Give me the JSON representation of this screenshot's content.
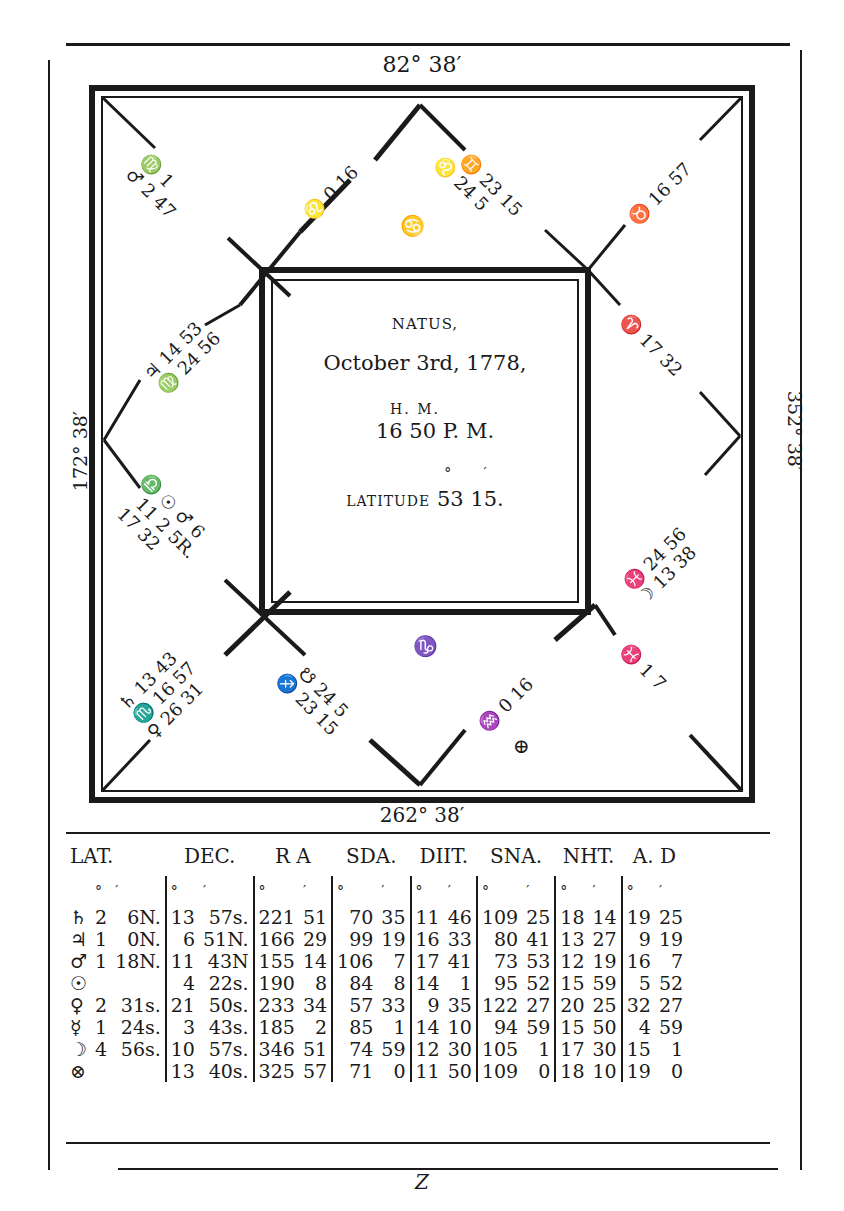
{
  "figure": {
    "type": "horoscope_square_chart",
    "midheaven_label": "82° 38′",
    "imum_coeli_label": "262° 38′",
    "ascendant_side_label": "172° 38′",
    "descendant_side_label": "352° 38′",
    "footer_letter": "Z"
  },
  "center": {
    "title": "NATUS,",
    "date": "October 3rd, 1778,",
    "time_units": "H.  M.",
    "time": "16 50 P. M.",
    "lat_units": "°  ′",
    "latitude_label": "LATITUDE",
    "latitude_value": "53 15."
  },
  "houses": [
    {
      "name": "house-10-cusp",
      "line1": "♌ 0 16"
    },
    {
      "name": "house-11-cusp",
      "line1": "♊ 23 15",
      "line2": "♌ 24 5"
    },
    {
      "name": "house-12-cusp",
      "line1": "♉ 16 57"
    },
    {
      "name": "house-9-cusp",
      "line1": "♍ 1",
      "line2": "♂ 2 47",
      "extra": "♉ 7"
    },
    {
      "name": "house-8-cusp",
      "line1": "♃ 14 53",
      "line2": "♍ 24 56"
    },
    {
      "name": "house-7-cusp",
      "line1": "♎ ☉ ♂ 6",
      "line2": "11 2 5R.",
      "line3": "17 32"
    },
    {
      "name": "house-1-cusp",
      "line1": "♈ 17 32"
    },
    {
      "name": "house-2-cusp",
      "line1": "♓ 24 56",
      "line2": "☽ 13 38"
    },
    {
      "name": "house-6-cusp",
      "line1": "♄ 13 43",
      "line2": "♏ 16 57",
      "line3": "♀ 26 31"
    },
    {
      "name": "house-5-cusp",
      "line1": "☋ 24 5",
      "line2": "♐ 23 15"
    },
    {
      "name": "house-4-cusp",
      "line1": "♒ 0 16"
    },
    {
      "name": "house-3-cusp",
      "line1": "♓ 1 7"
    },
    {
      "name": "sign-cancer",
      "line1": "♋"
    },
    {
      "name": "sign-capricorn",
      "line1": "♑"
    },
    {
      "name": "part-of-fortune",
      "line1": "⊕"
    }
  ],
  "table": {
    "headers": [
      "LAT.",
      "DEC.",
      "R A",
      "SDA.",
      "DIIT.",
      "SNA.",
      "NHT.",
      "A. D"
    ],
    "units": [
      "°",
      "′"
    ],
    "rows": [
      {
        "planet": "♄",
        "lat": [
          "2",
          "6N."
        ],
        "dec": [
          "13",
          "57s."
        ],
        "ra": [
          "221",
          "51"
        ],
        "sda": [
          "70",
          "35"
        ],
        "diit": [
          "11",
          "46"
        ],
        "sna": [
          "109",
          "25"
        ],
        "nht": [
          "18",
          "14"
        ],
        "ad": [
          "19",
          "25"
        ]
      },
      {
        "planet": "♃",
        "lat": [
          "1",
          "0N."
        ],
        "dec": [
          "6",
          "51N."
        ],
        "ra": [
          "166",
          "29"
        ],
        "sda": [
          "99",
          "19"
        ],
        "diit": [
          "16",
          "33"
        ],
        "sna": [
          "80",
          "41"
        ],
        "nht": [
          "13",
          "27"
        ],
        "ad": [
          "9",
          "19"
        ]
      },
      {
        "planet": "♂",
        "lat": [
          "1",
          "18N."
        ],
        "dec": [
          "11",
          "43N"
        ],
        "ra": [
          "155",
          "14"
        ],
        "sda": [
          "106",
          "7"
        ],
        "diit": [
          "17",
          "41"
        ],
        "sna": [
          "73",
          "53"
        ],
        "nht": [
          "12",
          "19"
        ],
        "ad": [
          "16",
          "7"
        ]
      },
      {
        "planet": "☉",
        "lat": [
          "",
          ""
        ],
        "dec": [
          "4",
          "22s."
        ],
        "ra": [
          "190",
          "8"
        ],
        "sda": [
          "84",
          "8"
        ],
        "diit": [
          "14",
          "1"
        ],
        "sna": [
          "95",
          "52"
        ],
        "nht": [
          "15",
          "59"
        ],
        "ad": [
          "5",
          "52"
        ]
      },
      {
        "planet": "♀",
        "lat": [
          "2",
          "31s."
        ],
        "dec": [
          "21",
          "50s."
        ],
        "ra": [
          "233",
          "34"
        ],
        "sda": [
          "57",
          "33"
        ],
        "diit": [
          "9",
          "35"
        ],
        "sna": [
          "122",
          "27"
        ],
        "nht": [
          "20",
          "25"
        ],
        "ad": [
          "32",
          "27"
        ]
      },
      {
        "planet": "☿",
        "lat": [
          "1",
          "24s."
        ],
        "dec": [
          "3",
          "43s."
        ],
        "ra": [
          "185",
          "2"
        ],
        "sda": [
          "85",
          "1"
        ],
        "diit": [
          "14",
          "10"
        ],
        "sna": [
          "94",
          "59"
        ],
        "nht": [
          "15",
          "50"
        ],
        "ad": [
          "4",
          "59"
        ]
      },
      {
        "planet": "☽",
        "lat": [
          "4",
          "56s."
        ],
        "dec": [
          "10",
          "57s."
        ],
        "ra": [
          "346",
          "51"
        ],
        "sda": [
          "74",
          "59"
        ],
        "diit": [
          "12",
          "30"
        ],
        "sna": [
          "105",
          "1"
        ],
        "nht": [
          "17",
          "30"
        ],
        "ad": [
          "15",
          "1"
        ]
      },
      {
        "planet": "⊗",
        "lat": [
          "",
          ""
        ],
        "dec": [
          "13",
          "40s."
        ],
        "ra": [
          "325",
          "57"
        ],
        "sda": [
          "71",
          "0"
        ],
        "diit": [
          "11",
          "50"
        ],
        "sna": [
          "109",
          "0"
        ],
        "nht": [
          "18",
          "10"
        ],
        "ad": [
          "19",
          "0"
        ]
      }
    ]
  }
}
